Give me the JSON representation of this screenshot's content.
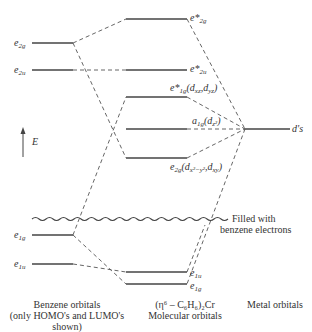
{
  "diagram": {
    "axis": {
      "label": "E",
      "icon": "arrow-up-icon"
    },
    "benzene_orbitals": [
      {
        "id": "e2g",
        "label": "e",
        "sub": "2g",
        "y": 43
      },
      {
        "id": "e2u",
        "label": "e",
        "sub": "2u",
        "y": 70
      },
      {
        "id": "e1g",
        "label": "e",
        "sub": "1g",
        "y": 235
      },
      {
        "id": "e1u",
        "label": "e",
        "sub": "1u",
        "y": 264
      }
    ],
    "molecular_orbitals": [
      {
        "id": "e*2g",
        "label": "e*",
        "sub": "2g",
        "extra": "",
        "y": 19
      },
      {
        "id": "e*2u",
        "label": "e*",
        "sub": "2u",
        "extra": "",
        "y": 70
      },
      {
        "id": "e*1g",
        "label": "e*",
        "sub": "1g",
        "extra": "(dxz, dyz)",
        "y": 97
      },
      {
        "id": "a1g",
        "label": "a",
        "sub": "1g",
        "extra": "(dz2)",
        "y": 129
      },
      {
        "id": "e2g_mo",
        "label": "e",
        "sub": "2g",
        "extra": "(dx2−y2, dxy)",
        "y": 158
      },
      {
        "id": "e1u_mo",
        "label": "e",
        "sub": "1u",
        "extra": "",
        "y": 272
      },
      {
        "id": "e1g_mo",
        "label": "e",
        "sub": "1g",
        "extra": "",
        "y": 284
      }
    ],
    "metal_orbitals": [
      {
        "id": "d",
        "label": "d's",
        "y": 129
      }
    ],
    "filled_annotation": {
      "line1": "Filled with",
      "line2": "benzene electrons"
    },
    "captions": {
      "benzene": {
        "line1": "Benzene orbitals",
        "line2": "(only HOMO's and LUMO's",
        "line3": "shown)"
      },
      "molecular": {
        "line1": "(η⁶ – C₆H₆)₂Cr",
        "line2": "Molecular orbitals"
      },
      "metal": {
        "line1": "Metal orbitals"
      }
    }
  }
}
